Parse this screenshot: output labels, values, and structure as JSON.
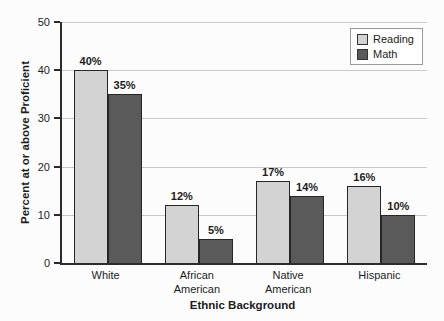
{
  "chart_data": {
    "type": "bar",
    "title": "",
    "xlabel": "Ethnic Background",
    "ylabel": "Percent at or above Proficient",
    "categories": [
      "White",
      "African\nAmerican",
      "Native\nAmerican",
      "Hispanic"
    ],
    "series": [
      {
        "name": "Reading",
        "color": "#d3d3d3",
        "values": [
          40,
          12,
          17,
          16
        ]
      },
      {
        "name": "Math",
        "color": "#5a5a5a",
        "values": [
          35,
          5,
          14,
          10
        ]
      }
    ],
    "data_label_format": "{v}%",
    "yticks": [
      0,
      10,
      20,
      30,
      40,
      50
    ],
    "ylim": [
      0,
      50
    ],
    "grid": true,
    "legend_position": "top-right"
  },
  "colors": {
    "background": "#fcfcfc",
    "axis": "#2b2b2b",
    "gridline": "#c9c9c9",
    "bar_border": "#262626",
    "reading_fill": "#d3d3d3",
    "math_fill": "#5a5a5a",
    "text": "#1c1c1c",
    "legend_border": "#9a9a9a"
  }
}
